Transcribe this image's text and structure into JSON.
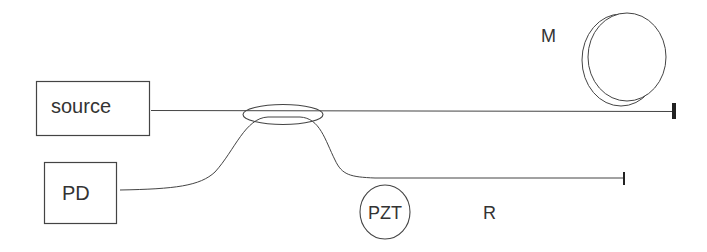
{
  "diagram": {
    "type": "fiber-optic-interferometer",
    "components": {
      "source": {
        "label": "source"
      },
      "photodetector": {
        "label": "PD"
      },
      "pzt": {
        "label": "PZT"
      },
      "measurement_arm": {
        "label": "M"
      },
      "reference_arm": {
        "label": "R"
      }
    },
    "colors": {
      "stroke": "#444444",
      "text": "#333333",
      "background": "#ffffff"
    }
  }
}
